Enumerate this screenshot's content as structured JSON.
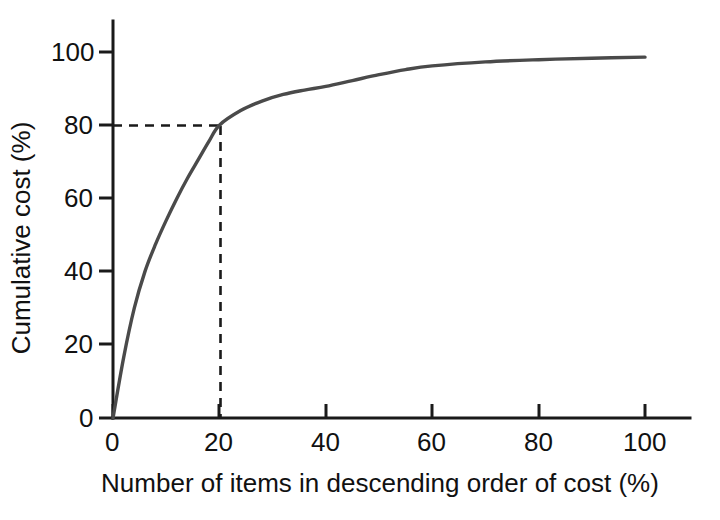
{
  "chart_data": {
    "type": "line",
    "title": "",
    "subtitle": "",
    "xlabel": "Number of items in descending order of cost (%)",
    "ylabel": "Cumulative cost (%)",
    "xlim": [
      0,
      108
    ],
    "ylim": [
      0,
      108
    ],
    "xticks": [
      0,
      20,
      40,
      60,
      80,
      100
    ],
    "yticks": [
      0,
      20,
      40,
      60,
      80,
      100
    ],
    "xtick_labels": [
      "0",
      "20",
      "40",
      "60",
      "80",
      "100"
    ],
    "ytick_labels": [
      "0",
      "20",
      "40",
      "60",
      "80",
      "100"
    ],
    "grid": false,
    "legend": false,
    "legend_position": "none",
    "series": [
      {
        "name": "Cumulative cost curve",
        "color": "#4a4a4a",
        "x": [
          0,
          2,
          4,
          6,
          8,
          10,
          12,
          14,
          16,
          18,
          20,
          24,
          28,
          32,
          36,
          40,
          45,
          50,
          55,
          60,
          70,
          80,
          90,
          100
        ],
        "y": [
          0,
          16.5,
          30.0,
          40.0,
          47.5,
          54.0,
          60.0,
          65.5,
          70.5,
          75.5,
          80.0,
          84.0,
          86.6,
          88.4,
          89.6,
          90.6,
          92.2,
          93.8,
          95.2,
          96.2,
          97.3,
          97.9,
          98.3,
          98.6
        ]
      }
    ],
    "annotations": [
      {
        "name": "eighty-percent-guide",
        "type": "dashed-guide",
        "x": 20,
        "y": 80,
        "description": "Dashed lines marking 20% of items accounting for 80% of cumulative cost"
      }
    ]
  },
  "axis_labels": {
    "x_title": "Number of items in descending order of cost (%)",
    "y_title": "Cumulative cost (%)"
  },
  "colors": {
    "curve": "#4a4a4a",
    "axis": "#1a1a1a",
    "guide": "#1a1a1a",
    "background": "#ffffff",
    "text": "#111111"
  }
}
